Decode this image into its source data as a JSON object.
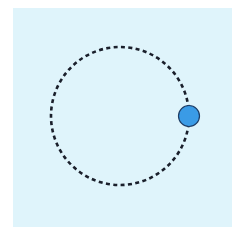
{
  "diagram": {
    "type": "circular-orbit",
    "background_color": "#dff4fb",
    "orbit": {
      "cx": 120,
      "cy": 116,
      "r": 69,
      "stroke_color": "#1a1f2b",
      "stroke_width": 2.6,
      "dash": "4 3.4"
    },
    "body": {
      "cx": 189,
      "cy": 116,
      "r": 10.5,
      "fill_color": "#3a9be6",
      "stroke_color": "#1d3d66"
    }
  }
}
